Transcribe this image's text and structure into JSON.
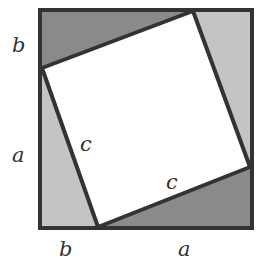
{
  "diagram": {
    "type": "pythagorean-proof",
    "outer_square": {
      "x1": 40,
      "y1": 10,
      "x2": 252,
      "y2": 228
    },
    "inner_vertices": [
      [
        193,
        11
      ],
      [
        250,
        167
      ],
      [
        98,
        227
      ],
      [
        42,
        68
      ]
    ],
    "colors": {
      "dark_triangle": "#8a8a8a",
      "light_triangle": "#c4c4c4",
      "inner_square": "#ffffff",
      "stroke": "#333333"
    },
    "labels": {
      "left_top": "b",
      "left_bottom": "a",
      "bottom_left": "b",
      "bottom_right": "a",
      "hyp_left": "c",
      "hyp_bottom": "c"
    }
  }
}
